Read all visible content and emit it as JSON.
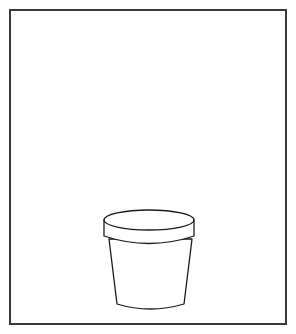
{
  "canvas": {
    "width": 296,
    "height": 334,
    "background": "#ffffff"
  },
  "frame": {
    "stroke": "#3a3a3a"
  },
  "illustration": {
    "subject": "flower-pot",
    "stroke": "#1a1a1a",
    "fill": "#ffffff"
  }
}
